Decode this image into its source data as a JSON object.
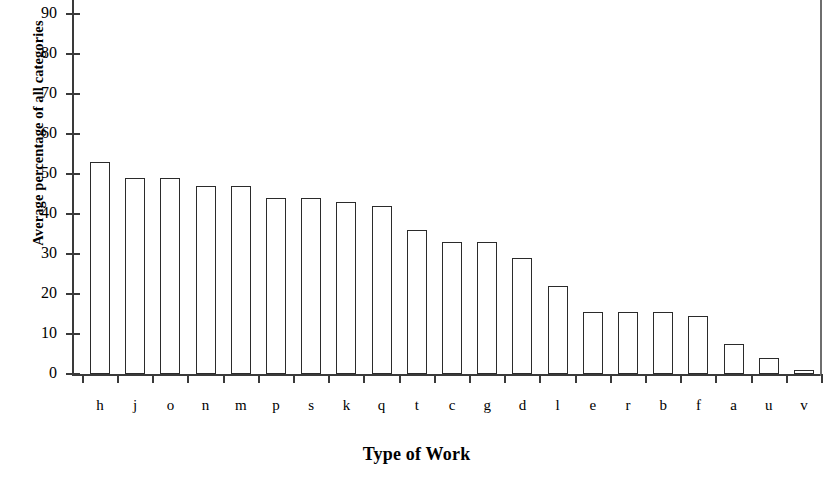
{
  "chart_data": {
    "type": "bar",
    "title": "",
    "xlabel": "Type of Work",
    "ylabel": "Average percentage of all categories",
    "categories": [
      "h",
      "j",
      "o",
      "n",
      "m",
      "p",
      "s",
      "k",
      "q",
      "t",
      "c",
      "g",
      "d",
      "l",
      "e",
      "r",
      "b",
      "f",
      "a",
      "u",
      "v"
    ],
    "values": [
      53,
      49,
      49,
      47,
      47,
      44,
      44,
      43,
      42,
      36,
      33,
      33,
      29,
      22,
      15.5,
      15.5,
      15.5,
      14.5,
      7.5,
      4,
      1
    ],
    "ylim": [
      0,
      95
    ],
    "ytick_labels": [
      "0",
      "10",
      "20",
      "30",
      "40",
      "50",
      "60",
      "70",
      "80",
      "90"
    ],
    "ytick_values": [
      0,
      10,
      20,
      30,
      40,
      50,
      60,
      70,
      80,
      90
    ],
    "grid": false,
    "legend": null,
    "bar_fill_color": "#ffffff",
    "bar_border_color": "#2b2b2b",
    "axis_color": "#3a3a3a"
  },
  "axes": {
    "y_title": "Average percentage of all categories",
    "x_title": "Type of Work"
  }
}
